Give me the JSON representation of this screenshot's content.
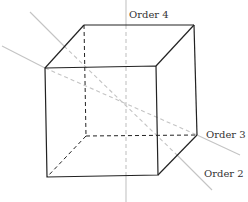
{
  "diagram": {
    "type": "cube-symmetry-axes",
    "labels": {
      "order4": "Order 4",
      "order3": "Order 3",
      "order2": "Order 2"
    },
    "colors": {
      "cube_edge": "#222222",
      "axis_line": "#c4c4c4",
      "label_text": "#333333"
    }
  }
}
